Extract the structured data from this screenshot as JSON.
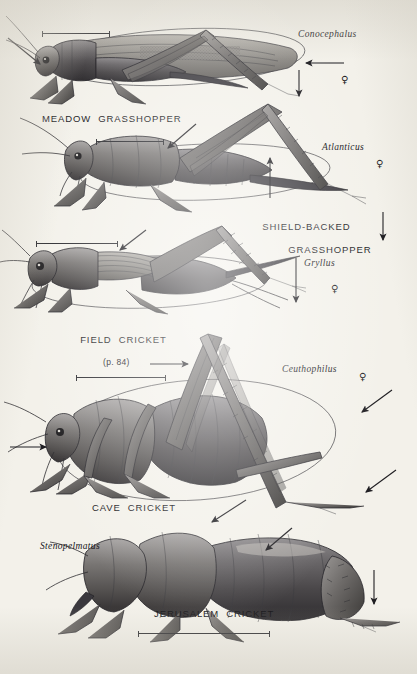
{
  "plate": {
    "title": "Long-horned grasshoppers and crickets plate",
    "background_color": "#f3f1ea",
    "ink_color": "#2d2c30"
  },
  "figures": [
    {
      "id": "meadow-grasshopper",
      "common_name": "MEADOW  GRASSHOPPER",
      "genus": "Conocephalus",
      "sex_symbol": "♀",
      "page_ref": ""
    },
    {
      "id": "shield-backed-grasshopper",
      "common_name": "SHIELD-BACKED",
      "common_name_line2": "GRASSHOPPER",
      "genus": "Atlanticus",
      "sex_symbol": "♀",
      "page_ref": ""
    },
    {
      "id": "field-cricket",
      "common_name": "FIELD  CRICKET",
      "genus": "Gryllus",
      "sex_symbol": "♀",
      "page_ref": "(p. 84)"
    },
    {
      "id": "cave-cricket",
      "common_name": "CAVE  CRICKET",
      "genus": "Ceuthophilus",
      "sex_symbol": "♀",
      "page_ref": ""
    },
    {
      "id": "jerusalem-cricket",
      "common_name": "JERUSALEM  CRICKET",
      "genus": "Stenopelmatus",
      "sex_symbol": "",
      "page_ref": ""
    }
  ]
}
